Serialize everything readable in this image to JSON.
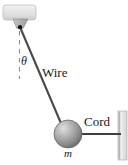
{
  "figure": {
    "type": "physics-free-body-diagram",
    "background_color": "#ffffff",
    "labels": {
      "angle": "θ",
      "wire": "Wire",
      "cord": "Cord",
      "mass": "m"
    },
    "colors": {
      "line": "#4a4a4a",
      "dashed_line": "#8a8a8a",
      "ceiling_fill": "#e4e4e4",
      "ceiling_stroke": "#b5b5b5",
      "bracket_fill": "#b9b9b9",
      "bracket_stroke": "#8f8f8f",
      "sphere_light": "#d7d7d7",
      "sphere_mid": "#a3a3a3",
      "sphere_dark": "#6e6e6e",
      "wall_fill": "#dcdcdc",
      "wall_stroke": "#b0b0b0",
      "pivot_dot": "#111111",
      "text": "#1a1a1a"
    },
    "geometry": {
      "ceiling": {
        "x": 3,
        "y": 5,
        "width": 33,
        "height": 15,
        "radius": 3
      },
      "bracket": {
        "top_left_x": 13,
        "top_right_x": 28,
        "top_y": 19,
        "bottom_left_x": 17,
        "bottom_right_x": 23,
        "bottom_y": 28
      },
      "pivot": {
        "x": 20,
        "y": 27,
        "radius": 2.1
      },
      "dashed_vertical": {
        "x": 19.5,
        "y_start": 31,
        "y_end": 79
      },
      "wire": {
        "x1": 20,
        "y1": 27,
        "x2": 62,
        "y2": 127
      },
      "sphere": {
        "cx": 68,
        "cy": 134,
        "r": 14
      },
      "cord": {
        "x1": 81,
        "y1": 134,
        "x2": 120,
        "y2": 134
      },
      "wall": {
        "x": 118,
        "y": 111,
        "width": 9,
        "height": 49
      }
    }
  }
}
